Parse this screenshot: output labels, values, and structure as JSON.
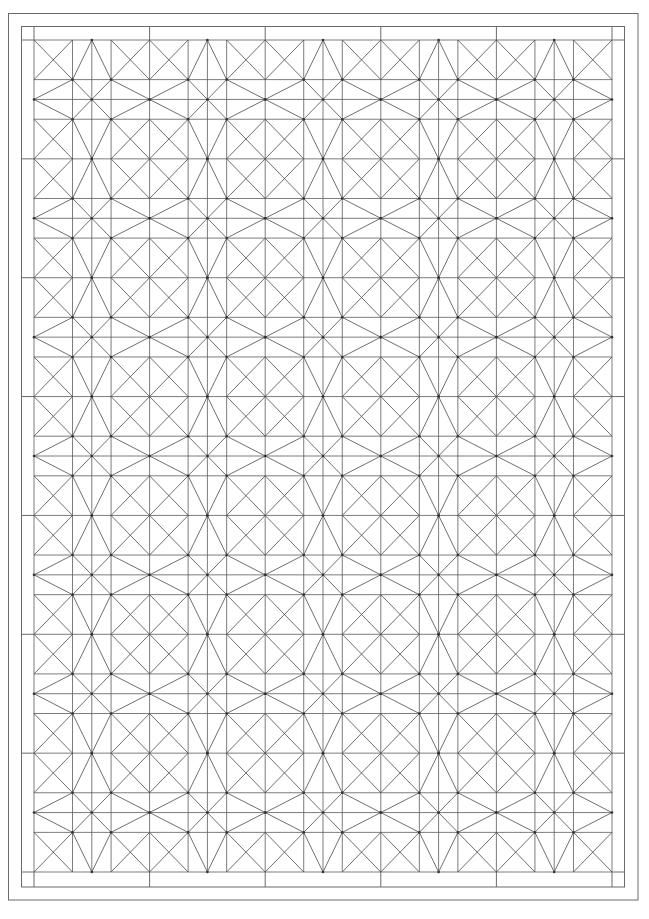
{
  "canvas": {
    "width": 649,
    "height": 919,
    "background": "#ffffff"
  },
  "colors": {
    "line": "#5a5a5a",
    "diagonal": "#4a4a4a",
    "frame": "#6a6a6a",
    "vertex": "#333333"
  },
  "frame": {
    "outer": {
      "x1": 8.5,
      "y1": 13.5,
      "x2": 638,
      "y2": 900
    },
    "inner": {
      "x1": 21.5,
      "y1": 26.5,
      "x2": 624.5,
      "y2": 887
    }
  },
  "grid": {
    "x0": 34,
    "y0": 40,
    "x1": 612,
    "y1": 872,
    "tiles_x": 5,
    "tiles_y": 7,
    "subdivision_fractions": [
      0,
      0.3333,
      0.5,
      0.6667,
      1
    ]
  },
  "tile_motif": {
    "description": "Each tile is split into a 4x4 sub-grid (wide, narrow, narrow, wide). Corner cells carry X diagonals; edge midpoints connect to the inner corners forming kites; center cross connects the four inner corners.",
    "corner_cells_x": [
      [
        0,
        0
      ],
      [
        3,
        0
      ],
      [
        0,
        3
      ],
      [
        3,
        3
      ]
    ],
    "segments": [
      [
        [
          2,
          0
        ],
        [
          1,
          1
        ]
      ],
      [
        [
          2,
          0
        ],
        [
          3,
          1
        ]
      ],
      [
        [
          0,
          2
        ],
        [
          1,
          1
        ]
      ],
      [
        [
          0,
          2
        ],
        [
          1,
          3
        ]
      ],
      [
        [
          4,
          2
        ],
        [
          3,
          1
        ]
      ],
      [
        [
          4,
          2
        ],
        [
          3,
          3
        ]
      ],
      [
        [
          2,
          4
        ],
        [
          1,
          3
        ]
      ],
      [
        [
          2,
          4
        ],
        [
          3,
          3
        ]
      ],
      [
        [
          1,
          1
        ],
        [
          3,
          3
        ]
      ],
      [
        [
          3,
          1
        ],
        [
          1,
          3
        ]
      ]
    ],
    "vertex_dots": [
      [
        1,
        1
      ],
      [
        3,
        1
      ],
      [
        1,
        3
      ],
      [
        3,
        3
      ],
      [
        2,
        2
      ],
      [
        2,
        0
      ],
      [
        0,
        2
      ],
      [
        4,
        2
      ],
      [
        2,
        4
      ]
    ]
  }
}
